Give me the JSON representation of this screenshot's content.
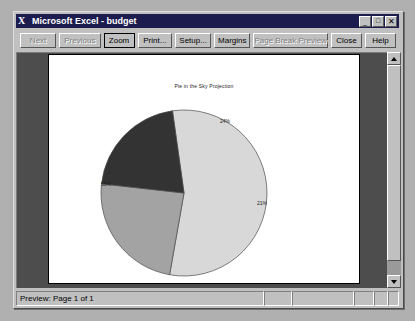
{
  "window": {
    "title": "Microsoft Excel - budget",
    "app_icon": "excel-x-icon",
    "buttons": {
      "minimize": "_",
      "maximize": "□",
      "close": "✕"
    }
  },
  "toolbar": {
    "items": [
      {
        "label": "Next",
        "name": "next-button",
        "state": "disabled",
        "width": 42
      },
      {
        "label": "Previous",
        "name": "previous-button",
        "state": "disabled",
        "width": 48
      },
      {
        "label": "Zoom",
        "name": "zoom-button",
        "state": "focused",
        "width": 36
      },
      {
        "label": "Print...",
        "name": "print-button",
        "state": "normal",
        "width": 40
      },
      {
        "label": "Setup...",
        "name": "setup-button",
        "state": "normal",
        "width": 42
      },
      {
        "label": "Margins",
        "name": "margins-button",
        "state": "normal",
        "width": 42
      },
      {
        "label": "Page Break Preview",
        "name": "page-break-preview-button",
        "state": "disabled",
        "width": 82
      },
      {
        "label": "Close",
        "name": "close-button",
        "state": "normal",
        "width": 36
      },
      {
        "label": "Help",
        "name": "help-button",
        "state": "normal",
        "width": 36
      }
    ]
  },
  "scrollbar": {
    "up_arrow": "triangle-up-icon",
    "down_arrow": "triangle-down-icon"
  },
  "statusbar": {
    "text": "Preview: Page 1 of 1"
  },
  "chart_data": {
    "type": "pie",
    "title": "Pie in the Sky Projection",
    "labels": [
      "Series 1",
      "Series 2",
      "Series 3"
    ],
    "values": [
      55,
      24,
      21
    ],
    "data_labels": [
      "55%",
      "21%",
      "24%"
    ],
    "colors": [
      "#d8d8d8",
      "#a3a3a3",
      "#333333"
    ],
    "show_percent": true,
    "legend": "none",
    "start_angle": -8
  }
}
